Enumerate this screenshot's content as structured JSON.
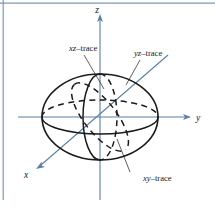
{
  "figure": {
    "caption_title": "Ellipsoid with coordinate-plane traces",
    "background_color": "#ffffff",
    "border_color": "#7d99b4",
    "axis_color": "#5b7fa6",
    "curve_color": "#1a1a1a"
  },
  "axes": [
    {
      "id": "x",
      "label": "x",
      "direction": "down-left",
      "arrow": true
    },
    {
      "id": "y",
      "label": "y",
      "direction": "right",
      "arrow": true
    },
    {
      "id": "z",
      "label": "z",
      "direction": "up",
      "arrow": true
    }
  ],
  "axis_labels": {
    "x": "x",
    "y": "y",
    "z": "z"
  },
  "traces": [
    {
      "id": "xz",
      "label_prefix": "xz",
      "label_suffix": "–trace",
      "label": "xz–trace",
      "plane": "xz",
      "style": "solid-and-dashed"
    },
    {
      "id": "yz",
      "label_prefix": "yz",
      "label_suffix": "–trace",
      "label": "yz–trace",
      "plane": "yz",
      "style": "dashed"
    },
    {
      "id": "xy",
      "label_prefix": "xy",
      "label_suffix": "–trace",
      "label": "xy–trace",
      "plane": "xy",
      "style": "solid-and-dashed"
    }
  ],
  "shape": {
    "name": "ellipsoid",
    "center": [
      100,
      117
    ],
    "semi_axis_horizontal": 58,
    "semi_axis_vertical": 43
  }
}
